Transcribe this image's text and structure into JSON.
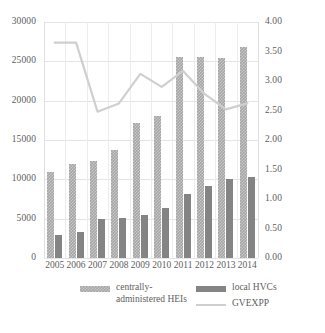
{
  "chart_data": {
    "type": "bar",
    "title": "",
    "xlabel": "",
    "ylabel": "",
    "categories": [
      "2005",
      "2006",
      "2007",
      "2008",
      "2009",
      "2010",
      "2011",
      "2012",
      "2013",
      "2014"
    ],
    "axes": {
      "left": {
        "ticks": [
          "0",
          "5000",
          "10000",
          "15000",
          "20000",
          "25000",
          "30000"
        ],
        "values": [
          0,
          5000,
          10000,
          15000,
          20000,
          25000,
          30000
        ],
        "ylim": [
          0,
          30000
        ]
      },
      "right": {
        "ticks": [
          "0.00",
          "0.50",
          "1.00",
          "1.50",
          "2.00",
          "2.50",
          "3.00",
          "3.50",
          "4.00"
        ],
        "values": [
          0,
          0.5,
          1.0,
          1.5,
          2.0,
          2.5,
          3.0,
          3.5,
          4.0
        ],
        "ylim": [
          0,
          4.0
        ]
      },
      "grid": true,
      "legend_position": "bottom"
    },
    "series": [
      {
        "name": "centrally-administered HEIs",
        "type": "bar",
        "axis": "left",
        "color": "#a6a6a6",
        "values": [
          10900,
          12000,
          12300,
          13700,
          17200,
          18100,
          25500,
          25500,
          25450,
          26800
        ]
      },
      {
        "name": "local HVCs",
        "type": "bar",
        "axis": "left",
        "color": "#848484",
        "values": [
          2900,
          3350,
          4900,
          5150,
          5450,
          6350,
          8200,
          9100,
          10100,
          10300
        ]
      },
      {
        "name": "GVEXPP",
        "type": "line",
        "axis": "right",
        "color": "#cfcfcf",
        "values": [
          3.65,
          3.65,
          2.48,
          2.62,
          3.12,
          2.9,
          3.17,
          2.78,
          2.52,
          2.62
        ]
      }
    ]
  },
  "legend": {
    "items": [
      {
        "label": "centrally-administered HEIs",
        "swatch": "pattern-light",
        "color": "#a6a6a6"
      },
      {
        "label": "local HVCs",
        "swatch": "solid-dark",
        "color": "#848484"
      },
      {
        "label": "GVEXPP",
        "swatch": "line-light",
        "color": "#cfcfcf"
      }
    ]
  }
}
